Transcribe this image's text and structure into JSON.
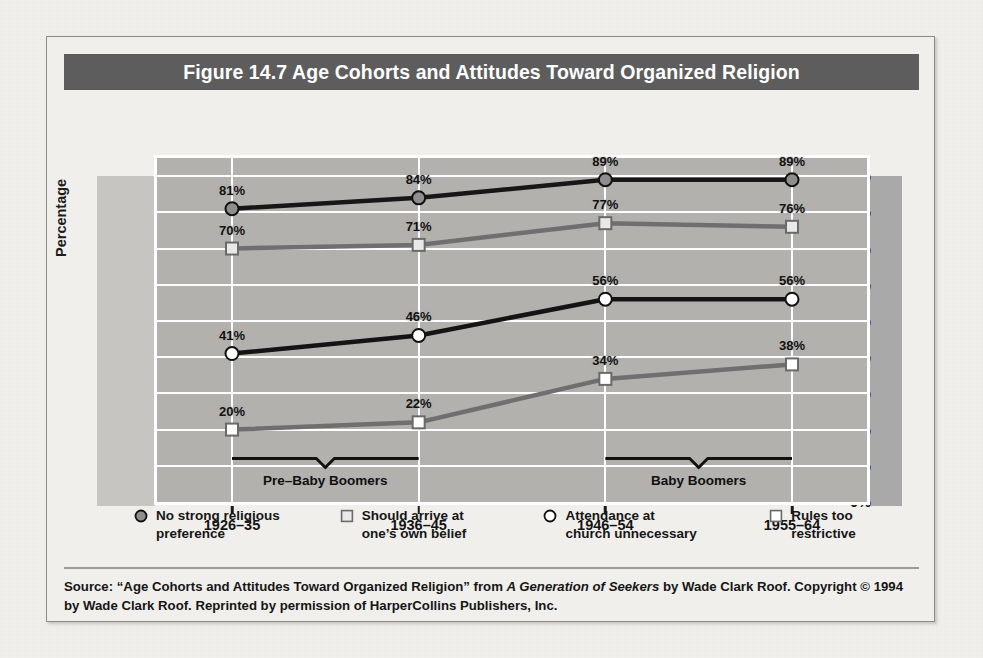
{
  "figure": {
    "title": "Figure 14.7  Age Cohorts and Attitudes Toward Organized Religion",
    "title_bg": "#5d5d5d",
    "frame_bg": "#f0efec",
    "page_bg": "#f2f1ee"
  },
  "chart_data": {
    "type": "line",
    "title": "Figure 14.7  Age Cohorts and Attitudes Toward Organized Religion",
    "xlabel": "",
    "ylabel": "Percentage",
    "categories": [
      "1926–35",
      "1936–45",
      "1946–54",
      "1955–64"
    ],
    "ylim": [
      0,
      95
    ],
    "yticks": [
      "0%",
      "10%",
      "20%",
      "30%",
      "40%",
      "50%",
      "60%",
      "70%",
      "80%",
      "90%"
    ],
    "ytick_values": [
      0,
      10,
      20,
      30,
      40,
      50,
      60,
      70,
      80,
      90
    ],
    "grid": true,
    "legend_position": "bottom",
    "series": [
      {
        "name": "No strong religious preference",
        "legend_label": "No strong religious\npreference",
        "values": [
          81,
          84,
          89,
          89
        ],
        "labels": [
          "81%",
          "84%",
          "89%",
          "89%"
        ],
        "line_color": "#171717",
        "marker": "circle",
        "marker_fill": "#8e8e8e",
        "marker_edge": "#111111"
      },
      {
        "name": "Should arrive at one's own belief",
        "legend_label": "Should arrive at\none’s own belief",
        "values": [
          70,
          71,
          77,
          76
        ],
        "labels": [
          "70%",
          "71%",
          "77%",
          "76%"
        ],
        "line_color": "#6f6f6f",
        "marker": "square",
        "marker_fill": "#e9e9e9",
        "marker_edge": "#6a6a6a"
      },
      {
        "name": "Attendance at church unnecessary",
        "legend_label": "Attendance at\nchurch unnecessary",
        "values": [
          41,
          46,
          56,
          56
        ],
        "labels": [
          "41%",
          "46%",
          "56%",
          "56%"
        ],
        "line_color": "#141414",
        "marker": "circle",
        "marker_fill": "#ffffff",
        "marker_edge": "#111111"
      },
      {
        "name": "Rules too restrictive",
        "legend_label": "Rules too\nrestrictive",
        "values": [
          20,
          22,
          34,
          38
        ],
        "labels": [
          "20%",
          "22%",
          "34%",
          "38%"
        ],
        "line_color": "#6f6f6f",
        "marker": "square",
        "marker_fill": "#ffffff",
        "marker_edge": "#6a6a6a"
      }
    ],
    "annotations": [
      {
        "label": "Pre–Baby Boomers",
        "from_category": 0,
        "to_category": 1
      },
      {
        "label": "Baby Boomers",
        "from_category": 2,
        "to_category": 3
      }
    ]
  },
  "source": {
    "line1_a": "Source: “Age Cohorts and Attitudes Toward Organized Religion” from ",
    "line1_italic": "A Generation of Seekers",
    "line1_b": " by Wade Clark Roof. Copyright",
    "line2": "© 1994 by Wade Clark Roof. Reprinted by permission of HarperCollins Publishers, Inc."
  }
}
